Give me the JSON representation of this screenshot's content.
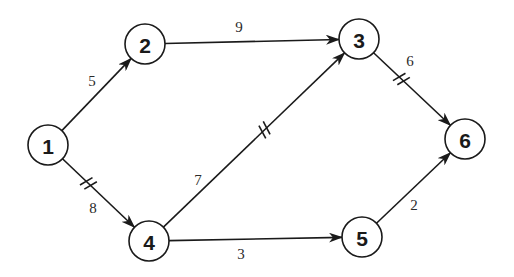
{
  "diagram": {
    "type": "directed-weighted-network",
    "nodes": [
      {
        "id": "1",
        "label": "1",
        "x": 48,
        "y": 145
      },
      {
        "id": "2",
        "label": "2",
        "x": 145,
        "y": 44
      },
      {
        "id": "3",
        "label": "3",
        "x": 359,
        "y": 39
      },
      {
        "id": "4",
        "label": "4",
        "x": 149,
        "y": 241
      },
      {
        "id": "5",
        "label": "5",
        "x": 362,
        "y": 237
      },
      {
        "id": "6",
        "label": "6",
        "x": 465,
        "y": 139
      }
    ],
    "edges": [
      {
        "from": "1",
        "to": "2",
        "weight": "5",
        "critical": false,
        "label_x": 92,
        "label_y": 81
      },
      {
        "from": "1",
        "to": "4",
        "weight": "8",
        "critical": true,
        "label_x": 93,
        "label_y": 208
      },
      {
        "from": "2",
        "to": "3",
        "weight": "9",
        "critical": false,
        "label_x": 239,
        "label_y": 27
      },
      {
        "from": "4",
        "to": "3",
        "weight": "7",
        "critical": true,
        "label_x": 198,
        "label_y": 180
      },
      {
        "from": "4",
        "to": "5",
        "weight": "3",
        "critical": false,
        "label_x": 241,
        "label_y": 254
      },
      {
        "from": "3",
        "to": "6",
        "weight": "6",
        "critical": true,
        "label_x": 410,
        "label_y": 61
      },
      {
        "from": "5",
        "to": "6",
        "weight": "2",
        "critical": false,
        "label_x": 414,
        "label_y": 205
      }
    ],
    "colors": {
      "stroke": "#1a1a1a",
      "background": "#ffffff"
    }
  }
}
